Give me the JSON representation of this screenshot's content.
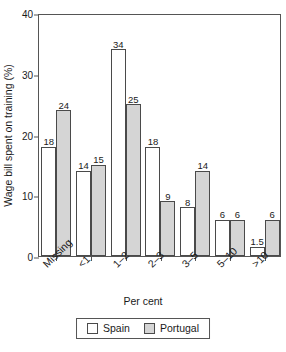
{
  "chart_data": {
    "type": "bar",
    "title": "",
    "subtitle": "",
    "xlabel": "Per cent",
    "ylabel": "Wage bill spent on training (%)",
    "categories": [
      "Missing",
      "<1",
      "1–2",
      "2–3",
      "3–5",
      "5–10",
      ">10"
    ],
    "series": [
      {
        "name": "Spain",
        "color": "#ffffff",
        "values": [
          18,
          14,
          34,
          18,
          8,
          6,
          1.5
        ],
        "labels": [
          "18",
          "14",
          "34",
          "18",
          "8",
          "6",
          "1.5"
        ]
      },
      {
        "name": "Portugal",
        "color": "#d5d5d5",
        "values": [
          24,
          15,
          25,
          9,
          14,
          6,
          6
        ],
        "labels": [
          "24",
          "15",
          "25",
          "9",
          "14",
          "6",
          "6"
        ]
      }
    ],
    "ylim": [
      0,
      40
    ],
    "yticks": [
      0,
      10,
      20,
      30,
      40
    ],
    "ytick_labels": [
      "0",
      "10",
      "20",
      "30",
      "40"
    ],
    "grid": false,
    "legend_position": "bottom",
    "legend_entries": [
      "Spain",
      "Portugal"
    ]
  }
}
